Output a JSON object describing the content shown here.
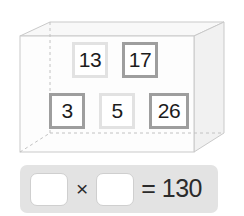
{
  "figure": {
    "shape_name": "rectangular-prism",
    "stroke_color": "#c9c9c9",
    "hidden_edge_color": "#bdbdbd",
    "top_face_color": "#f7f7f7",
    "side_face_color": "#f0f0f0",
    "front_face_color": "#fdfdfd"
  },
  "tiles": [
    {
      "value": "13",
      "border_style": "light",
      "border_color": "#e2e2e2",
      "left": 72,
      "top": 42,
      "size": 36
    },
    {
      "value": "17",
      "border_style": "dark",
      "border_color": "#9e9e9e",
      "left": 122,
      "top": 42,
      "size": 36
    },
    {
      "value": "3",
      "border_style": "dark",
      "border_color": "#9e9e9e",
      "left": 49,
      "top": 93,
      "size": 36
    },
    {
      "value": "5",
      "border_style": "light",
      "border_color": "#e2e2e2",
      "left": 99,
      "top": 93,
      "size": 36
    },
    {
      "value": "26",
      "border_style": "dark",
      "border_color": "#9e9e9e",
      "left": 149,
      "top": 93,
      "size": 40
    }
  ],
  "equation": {
    "panel_color": "#e3e3e3",
    "blank_first": "",
    "operator": "×",
    "blank_second": "",
    "equals_result": "= 130",
    "result_value": "130"
  }
}
